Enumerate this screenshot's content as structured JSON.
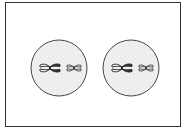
{
  "diagram": {
    "colors": {
      "frame": "#333333",
      "cell_outline": "#444444",
      "cytoplasm_stipple": "#888888",
      "chromosome": "#222222"
    },
    "cells": [
      {
        "name": "left-cell",
        "cx": 59,
        "cy": 68,
        "r": 28,
        "chromosomes": [
          {
            "size": "large",
            "cx": 50,
            "cy": 68
          },
          {
            "size": "small",
            "cx": 73,
            "cy": 68
          }
        ]
      },
      {
        "name": "right-cell",
        "cx": 131,
        "cy": 68,
        "r": 28,
        "chromosomes": [
          {
            "size": "large",
            "cx": 122,
            "cy": 68
          },
          {
            "size": "small",
            "cx": 145,
            "cy": 68
          }
        ]
      }
    ]
  }
}
